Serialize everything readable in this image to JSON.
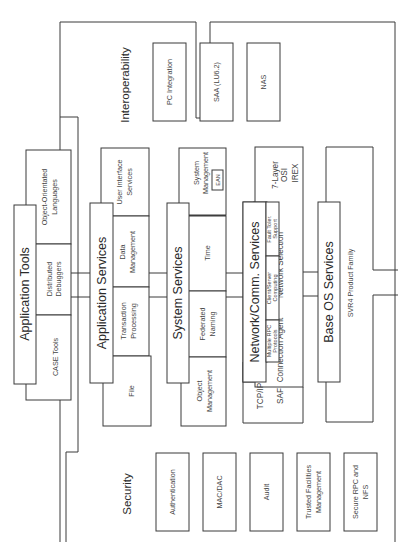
{
  "diagram": {
    "orientation": "rotated-90-ccw",
    "regions": {
      "interoperability": {
        "title": "Interoperability",
        "items": [
          "PC Integration",
          "SAA (LU6.2)",
          "NAS"
        ]
      },
      "security": {
        "title": "Security",
        "items": [
          "Authentication",
          "MAC/DAC",
          "Audit",
          "Trusted Facilities Management",
          "Secure RPC and NFS"
        ]
      }
    },
    "layers": {
      "application_tools": {
        "title": "Application Tools",
        "items": [
          "CASE Tools",
          "Distributed Debuggers",
          "Object-Orientated Languages"
        ]
      },
      "application_services": {
        "title": "Application Services",
        "items": [
          "File",
          "Transaction Processing",
          "Data Management",
          "User Interface Services"
        ]
      },
      "system_services": {
        "title": "System Services",
        "items": [
          "Object Management",
          "Federated Naming",
          "Time",
          "System Management"
        ],
        "sub_item": "EAN"
      },
      "network_services": {
        "title": "Network/Comm. Services",
        "items": {
          "multiple_rpc": "Multiple RPC Protocols",
          "client_server": "Client/Server Computing",
          "fault_tolerance": "Fault Toler. Support",
          "tcpip": "TCP/IP",
          "saf": "SAF",
          "connection_agent": "Connection Agent",
          "network_selection": "Network Selection",
          "osi": "7-Layer OSI",
          "irex": "IREX"
        }
      },
      "base_os": {
        "title": "Base OS Services",
        "items": [
          "SVR4 Product Family"
        ]
      }
    }
  }
}
